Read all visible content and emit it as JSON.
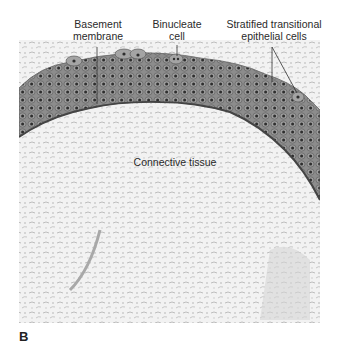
{
  "figure": {
    "panel_letter": "B",
    "labels": {
      "basement_membrane": [
        "Basement",
        "membrane"
      ],
      "binucleate_cell": [
        "Binucleate",
        "cell"
      ],
      "stratified_cells": [
        "Stratified transitional",
        "epithelial cells"
      ],
      "connective_tissue": "Connective tissue"
    },
    "colors": {
      "epithelium": "#8a8a8a",
      "nucleus": "#333333",
      "connective_bg": "#f1f1f1",
      "fiber": "#b8b8b8",
      "membrane": "#444444"
    }
  }
}
